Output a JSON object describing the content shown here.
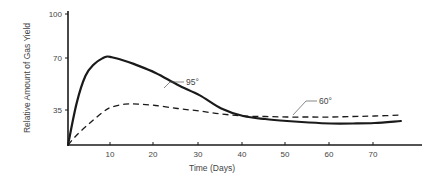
{
  "chart_data": {
    "type": "line",
    "title": "",
    "xlabel": "Time (Days)",
    "ylabel": "Relative Amount of Gas Yield",
    "xlim": [
      0,
      80
    ],
    "ylim": [
      0,
      100
    ],
    "x_ticks": [
      10,
      20,
      30,
      40,
      50,
      60,
      70
    ],
    "y_ticks": [
      35,
      70,
      100
    ],
    "grid": false,
    "legend": "inline labels",
    "series": [
      {
        "name": "95°",
        "style": "solid",
        "x": [
          0,
          2,
          4,
          6,
          8,
          9,
          10,
          12,
          15,
          20,
          25,
          30,
          35,
          40,
          45,
          50,
          55,
          60,
          65,
          70,
          76
        ],
        "values": [
          0,
          40,
          58,
          66,
          70,
          71,
          70.5,
          69,
          66,
          60,
          52,
          45,
          36,
          29,
          26,
          24,
          22.5,
          21.5,
          21.5,
          22,
          24
        ]
      },
      {
        "name": "60°",
        "style": "dashed",
        "x": [
          0,
          2,
          5,
          8,
          10,
          13,
          16,
          20,
          25,
          30,
          35,
          40,
          45,
          50,
          55,
          60,
          65,
          70,
          76
        ],
        "values": [
          0,
          10,
          22,
          33,
          37,
          39,
          39,
          38,
          36,
          34,
          31,
          29,
          28.5,
          28,
          28,
          28,
          28.5,
          29,
          30
        ]
      }
    ],
    "annotations": [
      {
        "text": "95°",
        "series": "95°"
      },
      {
        "text": "60°",
        "series": "60°"
      }
    ]
  },
  "axes": {
    "x_title": "Time (Days)",
    "y_title": "Relative Amount of Gas Yield",
    "x_tick_labels": [
      "10",
      "20",
      "30",
      "40",
      "50",
      "60",
      "70"
    ],
    "y_tick_labels": [
      "35",
      "70",
      "100"
    ]
  },
  "labels": {
    "series_95": "95°",
    "series_60": "60°"
  },
  "colors": {
    "line": "#1a1a1a",
    "axis": "#1a1a1a",
    "text": "#444444"
  }
}
